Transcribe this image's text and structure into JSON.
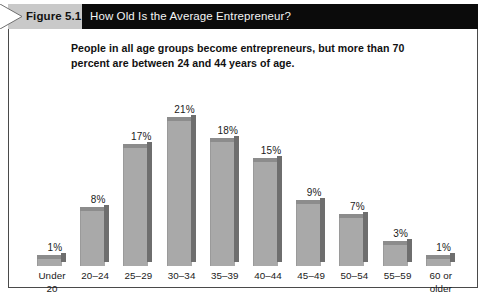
{
  "header": {
    "figure_tag": "Figure 5.1",
    "title": "How Old Is the Average Entrepreneur?",
    "bar_color": "#0b0b0b",
    "tag_color": "#c9c9c9"
  },
  "subtitle": "People in all age groups become entrepreneurs, but more than 70 percent are between 24 and 44 years of age.",
  "chart_data": {
    "type": "bar",
    "title": "How Old Is the Average Entrepreneur?",
    "subtitle": "People in all age groups become entrepreneurs, but more than 70 percent are between 24 and 44 years of age.",
    "xlabel": "",
    "ylabel": "",
    "ylim": [
      0,
      23
    ],
    "grid": false,
    "legend": "none",
    "bar_face_color": "#a9a9a9",
    "bar_side_color": "#6e6e6e",
    "bar_top_color": "#8c8c8c",
    "categories": [
      "Under 20",
      "20–24",
      "25–29",
      "30–34",
      "35–39",
      "40–44",
      "45–49",
      "50–54",
      "55–59",
      "60 or older"
    ],
    "category_lines": [
      [
        "Under",
        "20"
      ],
      [
        "20–24"
      ],
      [
        "25–29"
      ],
      [
        "30–34"
      ],
      [
        "35–39"
      ],
      [
        "40–44"
      ],
      [
        "45–49"
      ],
      [
        "50–54"
      ],
      [
        "55–59"
      ],
      [
        "60 or",
        "older"
      ]
    ],
    "values": [
      1,
      8,
      17,
      21,
      18,
      15,
      9,
      7,
      3,
      1
    ],
    "value_labels": [
      "1%",
      "8%",
      "17%",
      "21%",
      "18%",
      "15%",
      "9%",
      "7%",
      "3%",
      "1%"
    ]
  }
}
